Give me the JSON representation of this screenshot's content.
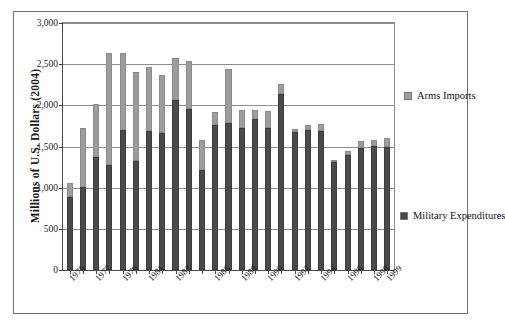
{
  "chart_data": {
    "type": "bar",
    "subtype": "stacked-vertical",
    "title": "",
    "xlabel": "",
    "ylabel": "Millions of U.S. Dollars (2004)",
    "ylim": [
      0,
      3000
    ],
    "ytick_values": [
      0,
      500,
      1000,
      1500,
      2000,
      2500,
      3000
    ],
    "ytick_labels": [
      "0",
      "500",
      "1,000",
      "1,500",
      "2,000",
      "2,500",
      "3,000"
    ],
    "grid": "horizontal",
    "legend_position": "right",
    "categories": [
      "1975",
      "1976",
      "1977",
      "1978",
      "1979",
      "1980",
      "1981",
      "1982",
      "1983",
      "1984",
      "1985",
      "1986",
      "1987",
      "1988",
      "1989",
      "1990",
      "1991",
      "1992",
      "1993",
      "1994",
      "1995",
      "1996",
      "1997",
      "1998",
      "1999"
    ],
    "xtick_labels_shown": [
      "1975",
      "1977",
      "1979",
      "1981",
      "1983",
      "1986",
      "1988",
      "1990",
      "1992",
      "1994",
      "1996",
      "1998",
      "1999"
    ],
    "series": [
      {
        "name": "Military Expenditures",
        "color": "#4a4a4a",
        "values": [
          890,
          1010,
          1370,
          1270,
          1700,
          1320,
          1690,
          1670,
          2060,
          1960,
          1220,
          1760,
          1790,
          1730,
          1830,
          1730,
          2140,
          1680,
          1700,
          1690,
          1310,
          1400,
          1480,
          1510,
          1500
        ]
      },
      {
        "name": "Arms Imports",
        "color": "#9d9d9d",
        "values": [
          170,
          715,
          650,
          1370,
          940,
          1080,
          780,
          700,
          520,
          580,
          360,
          160,
          650,
          210,
          110,
          200,
          120,
          30,
          60,
          80,
          30,
          40,
          90,
          70,
          100
        ]
      }
    ],
    "totals": [
      1060,
      1725,
      2020,
      2640,
      2640,
      2400,
      2470,
      2370,
      2580,
      2540,
      1580,
      1920,
      2440,
      1940,
      1940,
      1930,
      2260,
      1710,
      1760,
      1770,
      1340,
      1440,
      1570,
      1580,
      1600
    ]
  },
  "legend": {
    "arms_imports": "Arms Imports",
    "military_expenditures": "Military Expenditures"
  }
}
